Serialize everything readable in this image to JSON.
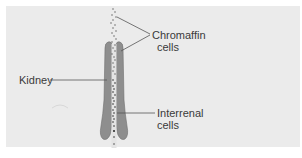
{
  "figure": {
    "background_color": "#ebebeb",
    "kidney_color": "#8c8c8c",
    "line_color": "#555555",
    "labels": {
      "chromaffin": {
        "line1": "Chromaffin",
        "line2": "cells"
      },
      "kidney": {
        "line1": "Kidney"
      },
      "interrenal": {
        "line1": "Interrenal",
        "line2": "cells"
      }
    }
  }
}
